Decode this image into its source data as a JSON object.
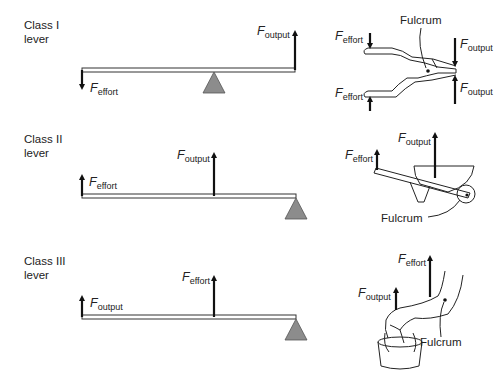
{
  "diagram": {
    "panels": [
      {
        "id": "class-1",
        "label_line1": "Class I",
        "label_line2": "lever",
        "lever_forces": {
          "left": "effort",
          "left_dir": "down",
          "right": "output",
          "right_dir": "up",
          "fulcrum_position": "middle"
        },
        "example": "pliers",
        "example_labels": {
          "fulcrum": "Fulcrum",
          "effort_top": "effort",
          "effort_bottom": "effort",
          "output_top": "output",
          "output_bottom": "output"
        }
      },
      {
        "id": "class-2",
        "label_line1": "Class II",
        "label_line2": "lever",
        "lever_forces": {
          "left": "effort",
          "left_dir": "up",
          "middle": "output",
          "middle_dir": "up",
          "fulcrum_position": "right end"
        },
        "example": "wheelbarrow",
        "example_labels": {
          "fulcrum": "Fulcrum",
          "effort": "effort",
          "output": "output"
        }
      },
      {
        "id": "class-3",
        "label_line1": "Class III",
        "label_line2": "lever",
        "lever_forces": {
          "left": "output",
          "left_dir": "up",
          "middle": "effort",
          "middle_dir": "up",
          "fulcrum_position": "right end"
        },
        "example": "forearm lifting bucket",
        "example_labels": {
          "fulcrum": "Fulcrum",
          "effort": "effort",
          "output": "output"
        }
      }
    ],
    "force_symbol": "F",
    "sub_effort": "effort",
    "sub_output": "output",
    "colors": {
      "fulcrum_fill": "#8c8c8c",
      "line": "#222222",
      "background": "#ffffff"
    }
  }
}
